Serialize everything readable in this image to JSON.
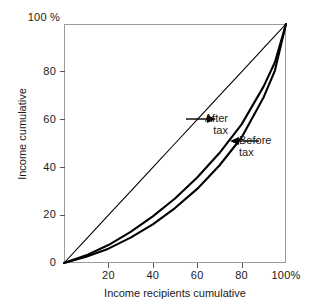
{
  "chart_data": {
    "type": "line",
    "title": "",
    "subtitle": "",
    "xlabel": "Income recipients cumulative",
    "ylabel": "Income cumulative",
    "xlim": [
      0,
      100
    ],
    "ylim": [
      0,
      100
    ],
    "grid": false,
    "legend_position": "inline-annotations",
    "x_tick_labels": [
      "20",
      "40",
      "60",
      "80",
      "100%"
    ],
    "x_tick_values": [
      20,
      40,
      60,
      80,
      100
    ],
    "y_tick_labels": [
      "0",
      "20",
      "40",
      "60",
      "80"
    ],
    "y_tick_values": [
      0,
      20,
      40,
      60,
      80
    ],
    "y_axis_top_label": "100 %",
    "x": [
      0,
      10,
      20,
      30,
      40,
      50,
      60,
      70,
      80,
      90,
      95,
      100
    ],
    "series": [
      {
        "name": "Line of equality",
        "style": "thin",
        "values": [
          0,
          10,
          20,
          30,
          40,
          50,
          60,
          70,
          80,
          90,
          95,
          100
        ]
      },
      {
        "name": "After tax",
        "style": "thick",
        "values": [
          0,
          3.2,
          7.5,
          13.0,
          19.5,
          27.0,
          35.8,
          46.0,
          58.0,
          74.0,
          84.0,
          100
        ]
      },
      {
        "name": "Before tax",
        "style": "thick",
        "values": [
          0,
          2.6,
          6.0,
          10.6,
          16.2,
          23.0,
          31.0,
          40.8,
          52.5,
          69.5,
          80.5,
          100
        ]
      }
    ],
    "annotations": [
      {
        "id": "after-tax",
        "line1": "After",
        "line2": "tax",
        "arrow": "right",
        "points_to": "After tax"
      },
      {
        "id": "before-tax",
        "line1": "Before",
        "line2": "tax",
        "arrow": "left",
        "points_to": "Before tax"
      }
    ],
    "colors": {
      "curve": "#000000",
      "frame": "#9a9a9a",
      "tick": "#5a5a5a",
      "text": "#1a1a1a",
      "background": "#ffffff"
    }
  }
}
